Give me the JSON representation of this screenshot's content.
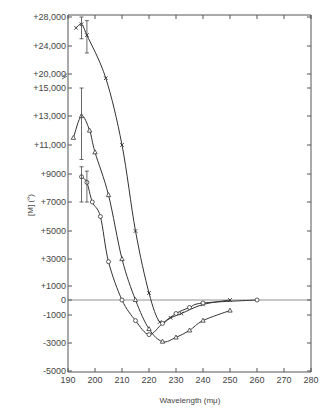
{
  "chart_data": {
    "type": "line",
    "title": "",
    "xlabel": "Wavelength (mμ)",
    "ylabel": "[M] (°)",
    "xlim": [
      190,
      280
    ],
    "ylim": [
      -5000,
      28000
    ],
    "x_ticks": [
      "190",
      "200",
      "210",
      "220",
      "230",
      "240",
      "250",
      "260",
      "270",
      "280"
    ],
    "y_ticks": [
      "+28,000",
      "+24,000",
      "+20,000",
      "+15,000",
      "+13,000",
      "+11,000",
      "+9000",
      "+7000",
      "+5000",
      "+3000",
      "+1000",
      "0",
      "-1000",
      "-3000",
      "-5000"
    ],
    "y_axis_break": "between +20,000 and +15,000",
    "grid": false,
    "series": [
      {
        "name": "x",
        "marker": "x",
        "x": [
          193,
          195,
          197,
          204,
          210,
          215,
          220,
          224,
          228,
          232,
          240,
          250
        ],
        "y": [
          26500,
          27000,
          25500,
          18500,
          11000,
          5000,
          500,
          -1500,
          -1200,
          -900,
          -300,
          0
        ]
      },
      {
        "name": "triangle",
        "marker": "triangle",
        "x": [
          192,
          195,
          198,
          200,
          205,
          210,
          215,
          220,
          225,
          230,
          235,
          240,
          250
        ],
        "y": [
          11500,
          13000,
          12000,
          10500,
          7500,
          3000,
          0,
          -2000,
          -2900,
          -2600,
          -2100,
          -1400,
          -700
        ]
      },
      {
        "name": "circle",
        "marker": "circle",
        "x": [
          195,
          197,
          199,
          202,
          205,
          210,
          215,
          220,
          225,
          230,
          235,
          240,
          260
        ],
        "y": [
          8800,
          8400,
          7000,
          6000,
          2800,
          0,
          -1400,
          -2400,
          -1600,
          -900,
          -500,
          -200,
          0
        ]
      }
    ],
    "error_bars": [
      {
        "x": 195,
        "y": 27000,
        "low": 25000,
        "high": 28000
      },
      {
        "x": 197,
        "y": 25500,
        "low": 23000,
        "high": 27500
      },
      {
        "x": 195,
        "y": 13000,
        "low": 10000,
        "high": 15000
      },
      {
        "x": 195,
        "y": 8800,
        "low": 7000,
        "high": 9500
      },
      {
        "x": 197,
        "y": 8400,
        "low": 7000,
        "high": 9200
      }
    ]
  }
}
